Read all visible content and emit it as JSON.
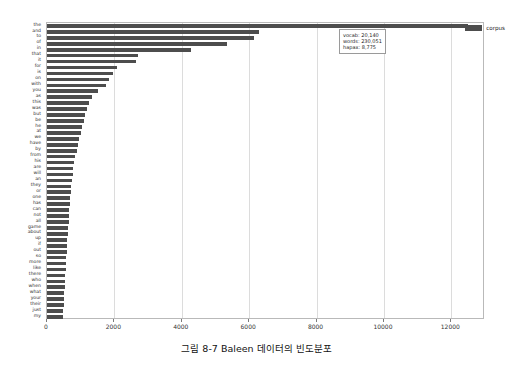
{
  "figure": {
    "caption": "그림 8-7  Baleen 데이터의 빈도분포"
  },
  "legend": {
    "label": "corpus",
    "swatch_color": "#4d4d4d",
    "position": "top-right"
  },
  "annotation": {
    "vocab": "vocab: 20,140",
    "words": "words: 230,051",
    "hapax": "hapax: 8,775"
  },
  "colors": {
    "bar": "#4d4d4d",
    "grid": "#dcdcdc",
    "frame": "#b9b9b9",
    "background": "#ffffff",
    "text": "#222222"
  },
  "chart_data": {
    "type": "bar",
    "orientation": "horizontal",
    "title": "",
    "xlabel": "",
    "ylabel": "",
    "xlim": [
      0,
      13000
    ],
    "ylim": [
      0,
      53
    ],
    "grid": true,
    "xticks": [
      0,
      2000,
      4000,
      6000,
      8000,
      10000,
      12000
    ],
    "xtick_labels": [
      "0",
      "2000",
      "4000",
      "6000",
      "8000",
      "10000",
      "12000"
    ],
    "legend_position": "upper right",
    "series_name": "corpus",
    "categories": [
      "the",
      "and",
      "to",
      "of",
      "in",
      "that",
      "it",
      "for",
      "is",
      "on",
      "with",
      "you",
      "as",
      "this",
      "was",
      "but",
      "be",
      "he",
      "at",
      "we",
      "have",
      "by",
      "from",
      "his",
      "are",
      "will",
      "an",
      "they",
      "or",
      "one",
      "has",
      "can",
      "not",
      "all",
      "game",
      "about",
      "up",
      "if",
      "out",
      "so",
      "more",
      "like",
      "there",
      "who",
      "when",
      "what",
      "your",
      "their",
      "just",
      "my"
    ],
    "values": [
      12500,
      6280,
      6150,
      5350,
      4280,
      2700,
      2640,
      2090,
      1950,
      1830,
      1760,
      1520,
      1330,
      1260,
      1180,
      1130,
      1090,
      1040,
      1010,
      960,
      920,
      880,
      840,
      800,
      780,
      760,
      740,
      720,
      700,
      690,
      680,
      660,
      650,
      640,
      630,
      620,
      600,
      590,
      580,
      570,
      560,
      550,
      545,
      535,
      525,
      515,
      505,
      495,
      485,
      470
    ]
  }
}
